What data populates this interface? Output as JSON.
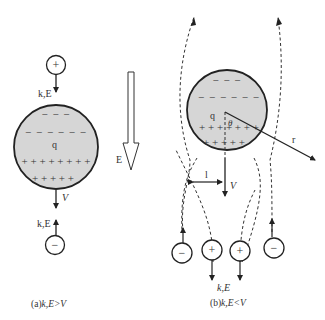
{
  "panel_a": {
    "caption": "(a) k,E>V",
    "caption_prefix": "(a)",
    "caption_math": "k,E>V",
    "sphere_charge_label": "q",
    "top_particle_sign": "+",
    "top_particle_label": "k,E",
    "bottom_particle_sign": "−",
    "bottom_particle_label": "k,E",
    "velocity_label": "V",
    "field_label": "E",
    "negative_rows": [
      "− − −",
      "− − − − − −"
    ],
    "positive_rows": [
      "+ + + + + + + +",
      "+ + + + +"
    ]
  },
  "panel_b": {
    "caption": "(b) k,E<V",
    "caption_prefix": "(b)",
    "caption_math": "k,E<V",
    "sphere_charge_label": "q",
    "angle_label": "θ",
    "radius_label": "r",
    "impact_label": "l",
    "velocity_label": "V",
    "particle_label": "k,E",
    "particles": [
      "−",
      "+",
      "+",
      "−"
    ],
    "negative_rows": [
      "− − −",
      "− − − − − −"
    ],
    "positive_rows": [
      "+ + + + + + +",
      "+ + + + +"
    ]
  },
  "colors": {
    "sphere_fill": "#d6d6d6",
    "stroke": "#222222",
    "text": "#333333"
  }
}
